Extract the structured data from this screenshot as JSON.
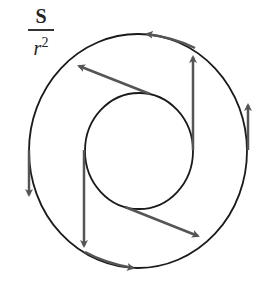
{
  "label": {
    "numerator": "S",
    "denominator": "r",
    "exponent": "2"
  },
  "colors": {
    "circle": "#1a1a1a",
    "arrow": "#555555",
    "background": "#ffffff"
  },
  "geometry": {
    "outer_circle": {
      "cx": 138,
      "cy": 151,
      "rx": 109,
      "ry": 117
    },
    "inner_circle": {
      "cx": 139,
      "cy": 151,
      "rx": 54,
      "ry": 58
    },
    "arrows": [
      {
        "name": "inner-top-left",
        "from": [
          150,
          94
        ],
        "to": [
          77,
          65
        ]
      },
      {
        "name": "inner-right-up",
        "from": [
          193,
          150
        ],
        "to": [
          193,
          55
        ]
      },
      {
        "name": "inner-left-down",
        "from": [
          84,
          150
        ],
        "to": [
          84,
          248
        ]
      },
      {
        "name": "inner-bottom-right",
        "from": [
          125,
          207
        ],
        "to": [
          200,
          237
        ]
      },
      {
        "name": "outer-left-down",
        "from": [
          29,
          150
        ],
        "to": [
          29,
          197
        ]
      },
      {
        "name": "outer-right-up",
        "from": [
          248,
          150
        ],
        "to": [
          248,
          103
        ]
      },
      {
        "name": "outer-top-tangent",
        "from": [
          195,
          50
        ],
        "to": [
          145,
          34
        ]
      },
      {
        "name": "outer-bottom-tangent",
        "from": [
          85,
          250
        ],
        "to": [
          135,
          268
        ]
      }
    ]
  }
}
